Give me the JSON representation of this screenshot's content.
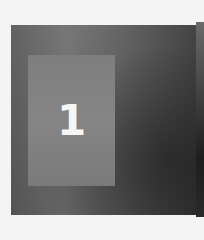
{
  "image": {
    "description": "Grayscale square with a lighter inner rectangle containing a numeral",
    "numeral": "1",
    "colors": {
      "background": "#f4f4f4",
      "outer_square": "#5f5f5f",
      "inner_rectangle": "#828282",
      "numeral": "#f6f6f6"
    }
  }
}
